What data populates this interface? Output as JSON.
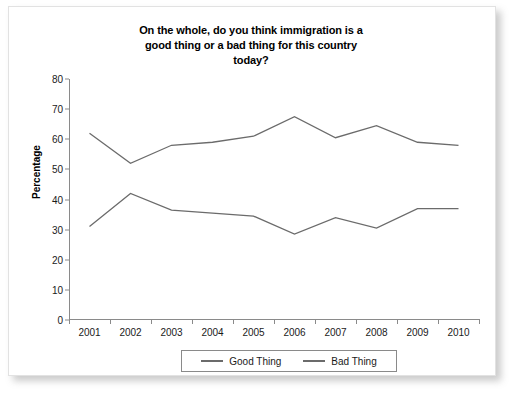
{
  "chart_data": {
    "type": "line",
    "title": "On the whole, do you think immigration is a good thing or a bad thing for this country today?",
    "title_lines": [
      "On the whole, do you think immigration is a",
      "good thing or a bad thing for this country",
      "today?"
    ],
    "xlabel": "",
    "ylabel": "Percentage",
    "categories": [
      "2001",
      "2002",
      "2003",
      "2004",
      "2005",
      "2006",
      "2007",
      "2008",
      "2009",
      "2010"
    ],
    "ylim": [
      0,
      80
    ],
    "yticks": [
      0,
      10,
      20,
      30,
      40,
      50,
      60,
      70,
      80
    ],
    "grid": false,
    "legend_position": "bottom",
    "series": [
      {
        "name": "Good Thing",
        "color": "#6b6b6b",
        "values": [
          31,
          42,
          36.5,
          35.5,
          34.5,
          28.5,
          34,
          30.5,
          37,
          37
        ]
      },
      {
        "name": "Bad Thing",
        "color": "#6b6b6b",
        "values": [
          62,
          52,
          58,
          59,
          61,
          67.5,
          60.5,
          64.5,
          59,
          58
        ]
      }
    ]
  },
  "legend": {
    "entries": [
      {
        "label": "Good Thing"
      },
      {
        "label": "Bad Thing"
      }
    ]
  }
}
